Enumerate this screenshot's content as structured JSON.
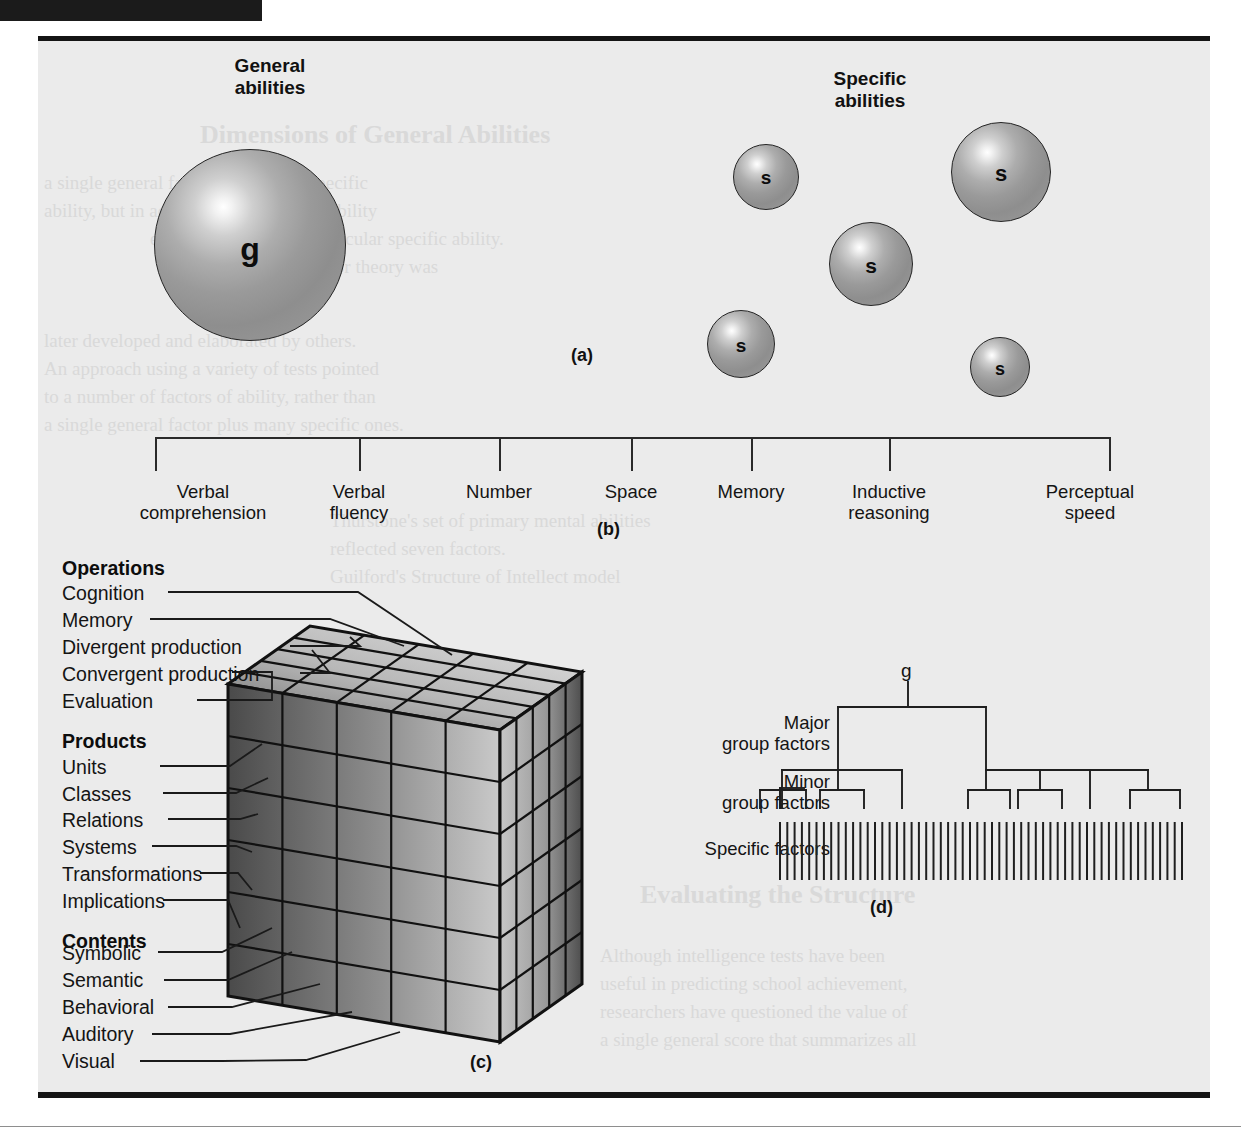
{
  "figure": {
    "background_color": "#ebebeb",
    "page_color": "#ffffff",
    "ink_color": "#141414"
  },
  "panel_a": {
    "letter": "(a)",
    "general_heading": "General\nabilities",
    "specific_heading": "Specific\nabilities",
    "general_sphere": {
      "label": "g",
      "cx": 250,
      "cy": 245,
      "r": 96
    },
    "specific_spheres": [
      {
        "label": "s",
        "cx": 766,
        "cy": 177,
        "r": 33
      },
      {
        "label": "s",
        "cx": 1001,
        "cy": 172,
        "r": 50
      },
      {
        "label": "s",
        "cx": 871,
        "cy": 264,
        "r": 42
      },
      {
        "label": "s",
        "cx": 741,
        "cy": 344,
        "r": 34
      },
      {
        "label": "s",
        "cx": 1000,
        "cy": 367,
        "r": 30
      }
    ]
  },
  "panel_b": {
    "letter": "(b)",
    "bracket": {
      "left": 155,
      "right": 1110,
      "top": 437,
      "tick_bottom": 470
    },
    "factors": [
      {
        "label": "Verbal\ncomprehension",
        "x": 182
      },
      {
        "label": "Verbal\nfluency",
        "x": 360
      },
      {
        "label": "Number",
        "x": 500
      },
      {
        "label": "Space",
        "x": 632
      },
      {
        "label": "Memory",
        "x": 752
      },
      {
        "label": "Inductive\nreasoning",
        "x": 890
      },
      {
        "label": "Perceptual\nspeed",
        "x": 1089
      }
    ]
  },
  "panel_c": {
    "letter": "(c)",
    "groups": [
      {
        "title": "Operations",
        "items": [
          "Cognition",
          "Memory",
          "Divergent production",
          "Convergent production",
          "Evaluation"
        ]
      },
      {
        "title": "Products",
        "items": [
          "Units",
          "Classes",
          "Relations",
          "Systems",
          "Transformations",
          "Implications"
        ]
      },
      {
        "title": "Contents",
        "items": [
          "Symbolic",
          "Semantic",
          "Behavioral",
          "Auditory",
          "Visual"
        ]
      }
    ],
    "cube": {
      "operations_divisions": 5,
      "products_divisions": 6,
      "contents_divisions": 5
    }
  },
  "panel_d": {
    "letter": "(d)",
    "apex_label": "g",
    "levels": [
      {
        "label": "Major\ngroup factors"
      },
      {
        "label": "Minor\ngroup factors"
      },
      {
        "label": "Specific factors"
      }
    ],
    "specific_factor_count": 56
  },
  "ghost_text": {
    "lines": [
      "Dimensions of General Abilities",
      "a single general factor and a set of specific",
      "ability, but in addition to this general ability",
      "each task demands a particular specific ability.",
      "Spearman's two-factor theory was",
      "later developed and elaborated by others.",
      "An approach using a variety of tests pointed",
      "to a number of factors of ability, rather than",
      "a single general factor plus many specific ones.",
      "Thurstone's set of primary mental abilities",
      "reflected seven factors.",
      "Guilford's Structure of Intellect model",
      "proposed 120 separate abilities arranged in",
      "three dimensions: operations, contents, products.",
      "Evaluating the Structure",
      "Although intelligence tests have been",
      "useful in predicting school achievement,",
      "researchers have questioned the value of",
      "a single general score that summarizes all"
    ]
  }
}
